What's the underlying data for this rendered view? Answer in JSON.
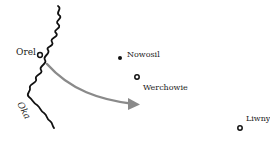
{
  "map": {
    "river": {
      "name": "Oka",
      "color": "#111111"
    },
    "arrow": {
      "color": "#8a8a8a"
    },
    "places": [
      {
        "name": "Orel",
        "marker": "ring",
        "x": 40,
        "y": 55
      },
      {
        "name": "Nowosil",
        "marker": "dot",
        "x": 120,
        "y": 58
      },
      {
        "name": "Werchowie",
        "marker": "ring",
        "x": 137,
        "y": 77
      },
      {
        "name": "Liwny",
        "marker": "ring",
        "x": 240,
        "y": 128
      }
    ]
  }
}
